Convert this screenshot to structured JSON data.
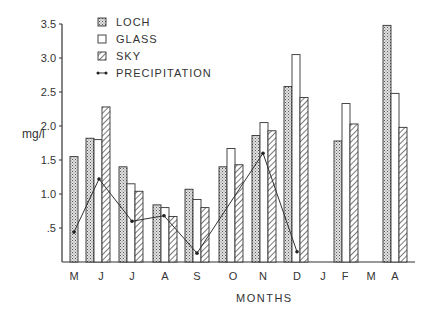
{
  "chart_data": {
    "type": "bar",
    "title": "",
    "xlabel": "MONTHS",
    "ylabel": "mg/l",
    "ylim": [
      0,
      3.5
    ],
    "yticks": [
      ".5",
      "1.0",
      "1.5",
      "2.0",
      "2.5",
      "3.0",
      "3.5"
    ],
    "ytick_values": [
      0.5,
      1.0,
      1.5,
      2.0,
      2.5,
      3.0,
      3.5
    ],
    "grid": false,
    "legend_position": "top-left inside",
    "categories": [
      "M",
      "J",
      "J",
      "A",
      "S",
      "O",
      "N",
      "D",
      "J",
      "F",
      "M",
      "A"
    ],
    "series": [
      {
        "name": "LOCH",
        "style": "stippled",
        "values": [
          1.55,
          1.82,
          1.4,
          0.84,
          1.07,
          1.4,
          1.86,
          2.58,
          null,
          1.78,
          null,
          3.48
        ]
      },
      {
        "name": "GLASS",
        "style": "open",
        "values": [
          null,
          1.8,
          1.15,
          0.8,
          0.92,
          1.67,
          2.05,
          3.05,
          null,
          2.33,
          null,
          2.48
        ]
      },
      {
        "name": "SKY",
        "style": "hatched",
        "values": [
          null,
          2.28,
          1.04,
          0.67,
          0.8,
          1.43,
          1.93,
          2.42,
          null,
          2.03,
          null,
          1.98
        ]
      },
      {
        "name": "PRECIPITATION",
        "style": "line",
        "values": [
          0.44,
          1.22,
          0.6,
          0.68,
          0.13,
          null,
          1.6,
          0.15,
          null,
          null,
          null,
          null
        ]
      }
    ]
  },
  "legend": {
    "items": [
      {
        "label": "LOCH"
      },
      {
        "label": "GLASS"
      },
      {
        "label": "SKY"
      },
      {
        "label": "PRECIPITATION"
      }
    ]
  },
  "layout": {
    "group_x": [
      70,
      86,
      119,
      153,
      185,
      219,
      252,
      284,
      318,
      334,
      367,
      383
    ],
    "label_x": [
      74,
      101,
      132,
      165,
      197,
      233,
      263,
      297,
      323,
      345,
      371,
      395
    ]
  },
  "colors": {
    "ink": "#333333",
    "stipple": "#b9b9b9",
    "background": "#ffffff"
  }
}
